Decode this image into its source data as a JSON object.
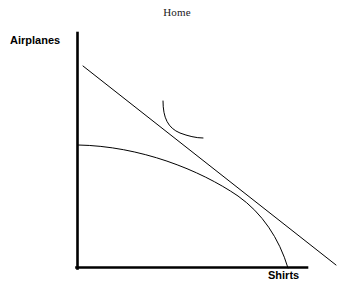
{
  "figure": {
    "title": "Home",
    "background_color": "#ffffff",
    "line_color": "#000000",
    "width": 354,
    "height": 288
  },
  "axes": {
    "y_axis_label": "Airplanes",
    "x_axis_label": "Shirts",
    "origin_x": 77,
    "origin_y": 268,
    "y_axis_top": 33,
    "x_axis_right": 307,
    "axis_stroke_width": 2.6
  },
  "chart_data": {
    "type": "line",
    "title": "Home",
    "xlabel": "Shirts",
    "ylabel": "Airplanes",
    "grid": false,
    "legend": "none",
    "axis_ticks": [],
    "series": [
      {
        "name": "production-possibility-frontier",
        "kind": "curve",
        "description": "Concave production possibility frontier from the Airplanes axis down to the Shirts axis",
        "path": "M 78 145 C 140 146 200 170 238 196 C 262 213 279 238 288 268",
        "stroke_width": 1.0
      },
      {
        "name": "budget-line",
        "kind": "line",
        "description": "Straight relative price line tangent to the PPF, extending beyond the axes",
        "x1": 83,
        "y1": 66,
        "x2": 336,
        "y2": 265,
        "stroke_width": 1.0
      },
      {
        "name": "indifference-curve",
        "kind": "curve",
        "description": "Convex indifference curve tangent to the budget line",
        "path": "M 163 101 C 163 118 168 128 180 133 C 188 136 196 138 203 138",
        "stroke_width": 1.0
      }
    ],
    "annotations": [
      {
        "name": "ppf-budget-tangency",
        "x": 248,
        "y": 203
      },
      {
        "name": "indifference-budget-tangency",
        "x": 176,
        "y": 128
      }
    ]
  }
}
